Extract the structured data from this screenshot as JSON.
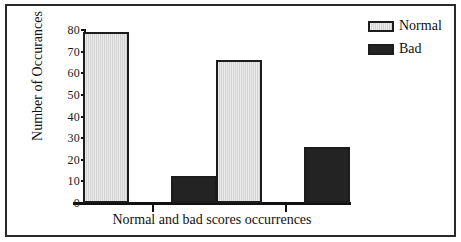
{
  "chart_data": {
    "type": "bar",
    "title": "",
    "xlabel": "Normal and bad scores occurrences",
    "ylabel": "Number of Occurances",
    "categories": [
      "Group 1",
      "Group 2"
    ],
    "series": [
      {
        "name": "Normal",
        "values": [
          79,
          66
        ],
        "color": "#d2d2d2"
      },
      {
        "name": "Bad",
        "values": [
          12.5,
          26
        ],
        "color": "#232323"
      }
    ],
    "ylim": [
      0,
      80
    ],
    "ytick_labels": [
      "0",
      "10",
      "20",
      "30",
      "40",
      "50",
      "60",
      "70",
      "80"
    ],
    "ytick_values": [
      0,
      10,
      20,
      30,
      40,
      50,
      60,
      70,
      80
    ],
    "grid": false,
    "legend_position": "right-top",
    "legend_entries": [
      "Normal",
      "Bad"
    ]
  },
  "figure": {
    "frame_color": "#2a2a2a",
    "axis_color": "#111111",
    "background": "#ffffff"
  }
}
